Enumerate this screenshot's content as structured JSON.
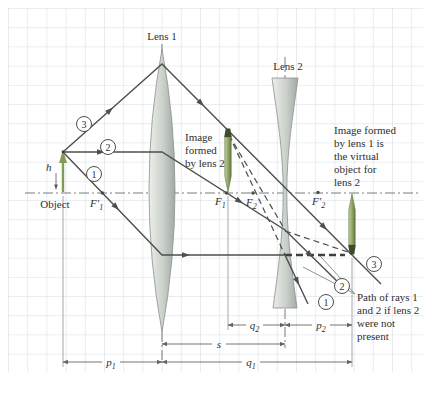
{
  "figure": {
    "lens1_label": "Lens 1",
    "lens2_label": "Lens 2",
    "object_label": "Object",
    "h_label": "h",
    "rays": [
      "1",
      "2",
      "3"
    ],
    "focals": {
      "f1p": {
        "main": "F′",
        "sub": "1"
      },
      "f1": {
        "main": "F",
        "sub": "1"
      },
      "f2": {
        "main": "F",
        "sub": "2"
      },
      "f2p": {
        "main": "F′",
        "sub": "2"
      }
    },
    "dims": {
      "p1": {
        "main": "p",
        "sub": "1"
      },
      "q1": {
        "main": "q",
        "sub": "1"
      },
      "s": {
        "main": "s",
        "sub": ""
      },
      "q2": {
        "main": "q",
        "sub": "2"
      },
      "p2": {
        "main": "p",
        "sub": "2"
      }
    },
    "annotations": {
      "image2": [
        "Image",
        "formed",
        "by lens 2"
      ],
      "image1": [
        "Image formed",
        "by lens 1 is",
        "the virtual",
        "object for",
        "lens 2"
      ],
      "path": [
        "Path of rays 1",
        "and 2 if lens 2",
        "were not",
        "present"
      ]
    },
    "colors": {
      "grid": "#d4dbe1",
      "ray": "#4e4e4c",
      "object_green": "#7f9d55",
      "pencil_head": "#3e4a2c",
      "axis": "#767a7c",
      "text": "#2f2f2f"
    }
  }
}
